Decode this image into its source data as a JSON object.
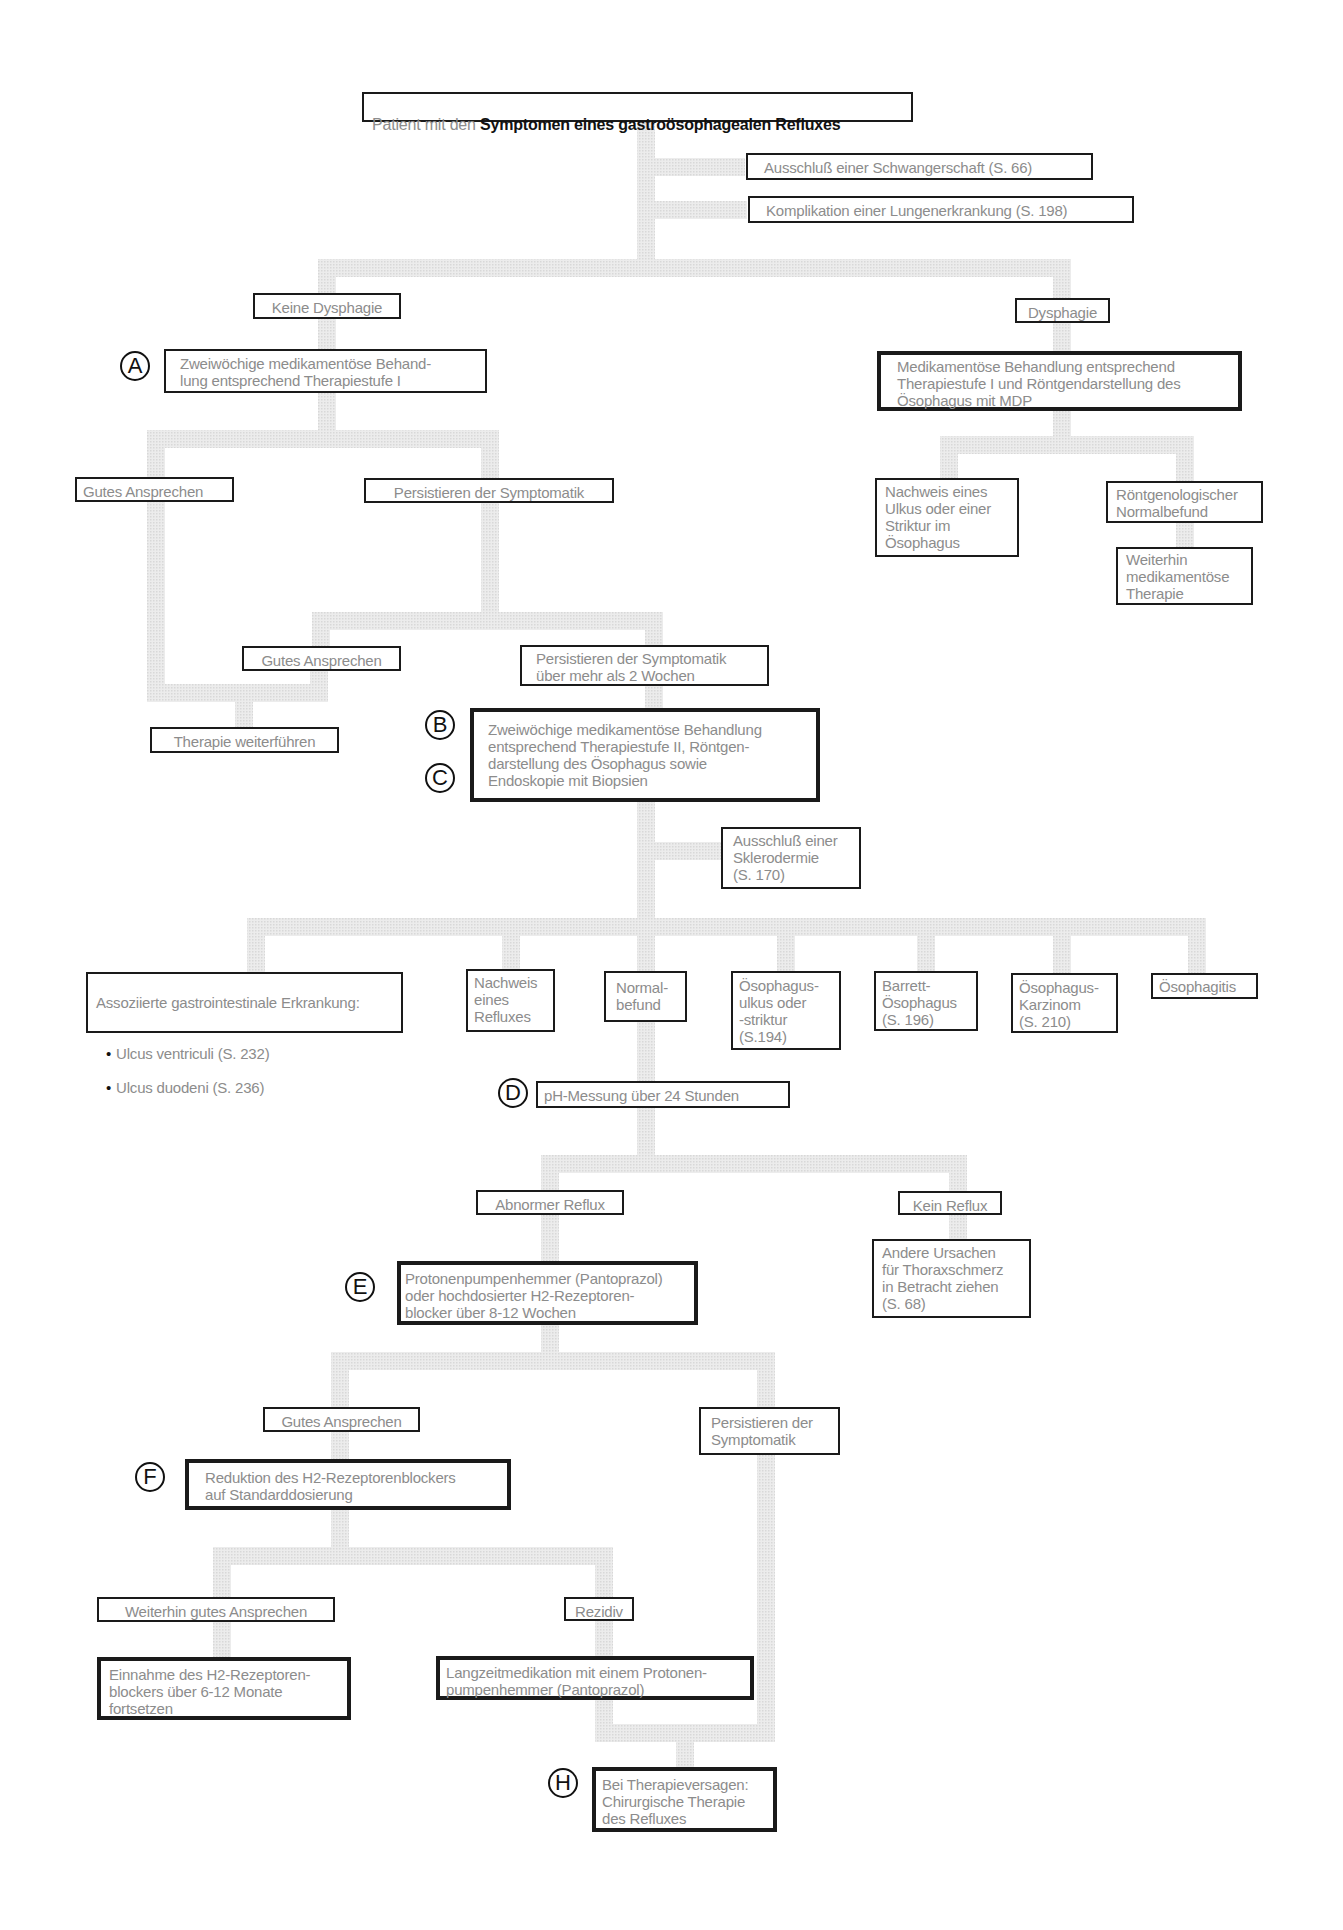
{
  "title": {
    "prefix": "Patient mit den ",
    "highlight": "Symptomen eines gastroösophagealen Refluxes"
  },
  "nodes": {
    "schwangerschaft": "Ausschluß einer Schwangerschaft (S. 66)",
    "lungenerkrankung": "Komplikation einer Lungenerkrankung (S. 198)",
    "keine_dysphagie": "Keine Dysphagie",
    "dysphagie": "Dysphagie",
    "step_a": "Zweiwöchige medikamentöse Behand-\nlung entsprechend Therapiestufe I",
    "dysphagie_treatment": "Medikamentöse Behandlung entsprechend\nTherapiestufe I und Röntgendarstellung des\nÖsophagus mit MDP",
    "gutes_ansprechen_1": "Gutes Ansprechen",
    "persistieren_1": "Persistieren der Symptomatik",
    "nachweis_ulkus": "Nachweis eines\nUlkus oder einer\nStriktur im\nÖsophagus",
    "roentgen_normal": "Röntgenologischer\nNormalbefund",
    "weiterhin_therapie": "Weiterhin\nmedikamentöse\nTherapie",
    "gutes_ansprechen_2": "Gutes Ansprechen",
    "persistieren_2": "Persistieren der Symptomatik\nüber mehr als 2 Wochen",
    "therapie_weiterfuehren": "Therapie weiterführen",
    "step_bc": "Zweiwöchige medikamentöse  Behandlung\nentsprechend Therapiestufe II, Röntgen-\ndarstellung des Ösophagus sowie\nEndoskopie mit Biopsien",
    "sklerodermie": "Ausschluß einer\nSklerodermie\n(S. 170)",
    "assoziiert_title": "Assoziierte gastrointestinale Erkrankung:",
    "assoziiert_items": [
      "Ulcus ventriculi (S. 232)",
      "Ulcus duodeni (S. 236)"
    ],
    "nachweis_reflux": "Nachweis\neines\nRefluxes",
    "normalbefund": "Normal-\nbefund",
    "oesophagusulkus": "Ösophagus-\nulkus oder\n-striktur\n(S.194)",
    "barrett": "Barrett-\nÖsophagus\n(S. 196)",
    "karzinom": "Ösophagus-\nKarzinom\n(S. 210)",
    "oesophagitis": "Ösophagitis",
    "step_d": "pH-Messung über 24 Stunden",
    "abnormer_reflux": "Abnormer Reflux",
    "kein_reflux": "Kein Reflux",
    "step_e": "Protonenpumpenhemmer (Pantoprazol)\noder hochdosierter H2-Rezeptoren-\nblocker  über 8-12 Wochen",
    "andere_ursachen": "Andere Ursachen\nfür Thoraxschmerz\nin Betracht ziehen\n(S. 68)",
    "gutes_ansprechen_3": "Gutes Ansprechen",
    "persistieren_3": "Persistieren der\nSymptomatik",
    "step_f": "Reduktion des H2-Rezeptorenblockers\nauf Standarddosierung",
    "weiterhin_gut": "Weiterhin gutes Ansprechen",
    "rezidiv": "Rezidiv",
    "einnahme": "Einnahme des H2-Rezeptoren-\nblockers über 6-12 Monate\nfortsetzen",
    "langzeit": "Langzeitmedikation mit einem Protonen-\npumpenhemmer (Pantoprazol)",
    "step_h": "Bei Therapieversagen:\nChirurgische Therapie\ndes Refluxes"
  },
  "markers": {
    "a": "A",
    "b": "B",
    "c": "C",
    "d": "D",
    "e": "E",
    "f": "F",
    "h": "H"
  },
  "colors": {
    "connector": "#e4e4e4",
    "border": "#1a1a1a",
    "text": "#8c8c8c"
  }
}
